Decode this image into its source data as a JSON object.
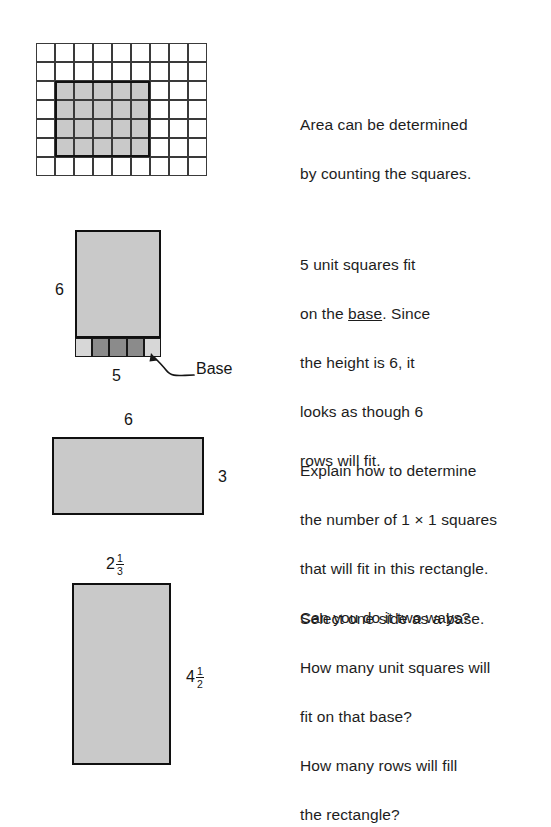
{
  "page": {
    "background_color": "#ffffff",
    "fill_gray": "#c9c9c9",
    "dark_unit_gray": "#8b8b8b",
    "light_unit_gray": "#d7d7d7",
    "outline_color": "#101010"
  },
  "figures": {
    "counting_grid": {
      "columns": 9,
      "rows": 7,
      "cell_size": 19,
      "shaded_region": {
        "start_column": 2,
        "start_row": 3,
        "width_cells": 5,
        "height_cells": 4
      }
    },
    "base_rectangle": {
      "height_label": "6",
      "base_label": "5",
      "callout_label": "Base",
      "base_row_cells": [
        "light",
        "dark",
        "dark",
        "dark",
        "light"
      ],
      "base_row_cell_count": 5
    },
    "six_by_three_rectangle": {
      "top_label": "6",
      "right_label": "3"
    },
    "mixed_number_rectangle": {
      "top_label": {
        "whole": "2",
        "numerator": "1",
        "denominator": "3"
      },
      "right_label": {
        "whole": "4",
        "numerator": "1",
        "denominator": "2"
      }
    }
  },
  "texts": {
    "area_counting": {
      "line1": "Area can be determined",
      "line2": "by counting the squares."
    },
    "base_explanation": {
      "line1_pre": "5 unit squares fit",
      "line2_pre": "on the ",
      "line2_underlined": "base",
      "line2_post": ". Since",
      "line3": "the height is 6, it",
      "line4": "looks as though 6",
      "line5": "rows will fit."
    },
    "explain_prompt": {
      "line1": "Explain how to determine",
      "line2": "the number of 1 × 1 squares",
      "line3": "that will fit in this rectangle.",
      "line4": "Can you do it two ways?"
    },
    "select_base_prompt": {
      "line1": "Select one side as a base.",
      "line2": "How many unit squares will",
      "line3": "fit on that base?",
      "line4": "How many rows will fill",
      "line5": "the rectangle?"
    }
  }
}
